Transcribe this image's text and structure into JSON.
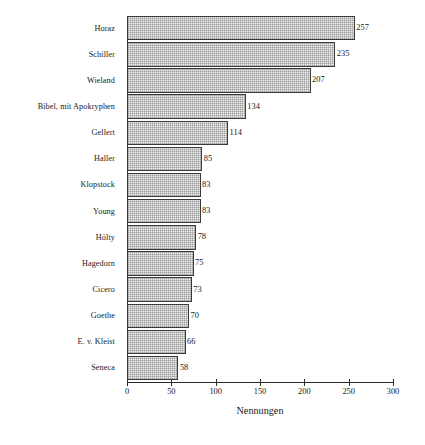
{
  "chart_data": {
    "type": "bar",
    "orientation": "horizontal",
    "title": "",
    "xlabel": "Nennungen",
    "ylabel": "",
    "xlim": [
      0,
      300
    ],
    "xticks": [
      0,
      50,
      100,
      150,
      200,
      250,
      300
    ],
    "xtick_labels": [
      "0",
      "50",
      "100",
      "150",
      "200",
      "250",
      "300"
    ],
    "grid": false,
    "legend": null,
    "categories": [
      "Horaz",
      "Schiller",
      "Wieland",
      "Bibel, mit Apokryphen",
      "Gellert",
      "Haller",
      "Klopstock",
      "Young",
      "Hölty",
      "Hagedorn",
      "Cicero",
      "Goethe",
      "E. v. Kleist",
      "Seneca"
    ],
    "values": [
      257,
      235,
      207,
      134,
      114,
      85,
      83,
      83,
      78,
      75,
      73,
      70,
      66,
      58
    ],
    "data_labels": [
      "257",
      "235",
      "207",
      "134",
      "114",
      "85",
      "83",
      "83",
      "78",
      "75",
      "73",
      "70",
      "66",
      "58"
    ],
    "bar_fill_color": "#f0f0f0",
    "bar_edge_color": "#3a3a3a",
    "axis_color": "#2b2b2b"
  }
}
